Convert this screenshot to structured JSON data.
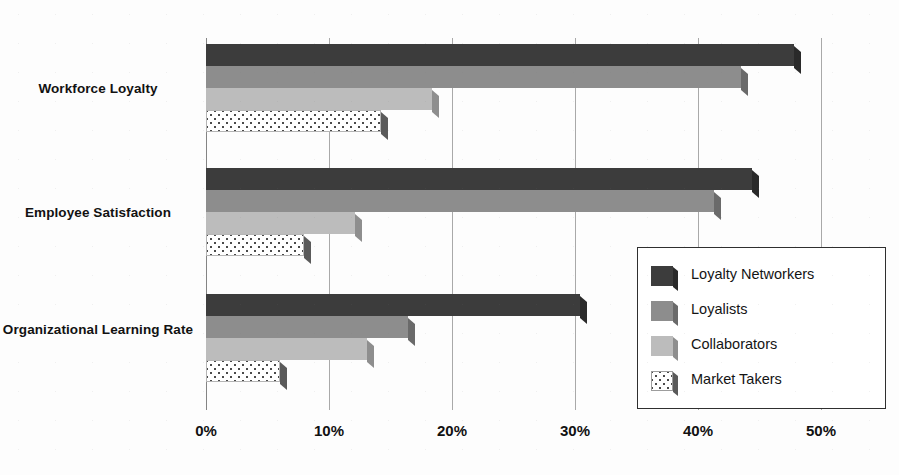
{
  "chart_data": {
    "type": "bar",
    "orientation": "horizontal",
    "title": "",
    "xlabel": "",
    "ylabel": "",
    "xlim": [
      0,
      50
    ],
    "xtick_labels": [
      "0%",
      "10%",
      "20%",
      "30%",
      "40%",
      "50%"
    ],
    "xticks": [
      0,
      10,
      20,
      30,
      40,
      50
    ],
    "grid": true,
    "legend_position": "center-right",
    "categories": [
      "Workforce Loyalty",
      "Employee Satisfaction",
      "Organizational Learning Rate"
    ],
    "series": [
      {
        "name": "Loyalty Networkers",
        "color": "#3c3c3c",
        "values": [
          47.8,
          44.4,
          30.4
        ]
      },
      {
        "name": "Loyalists",
        "color": "#8d8d8d",
        "values": [
          43.5,
          41.3,
          16.4
        ]
      },
      {
        "name": "Collaborators",
        "color": "#bcbcbc",
        "values": [
          18.4,
          12.1,
          13.1
        ]
      },
      {
        "name": "Market Takers",
        "color": "#ffffff",
        "values": [
          14.2,
          8.0,
          6.0
        ]
      }
    ]
  },
  "legend": {
    "entries": [
      "Loyalty Networkers",
      "Loyalists",
      "Collaborators",
      "Market Takers"
    ]
  },
  "axis": {
    "x_ticks": [
      "0%",
      "10%",
      "20%",
      "30%",
      "40%",
      "50%"
    ]
  },
  "categories": {
    "labels": [
      "Workforce Loyalty",
      "Employee Satisfaction",
      "Organizational Learning Rate"
    ]
  }
}
